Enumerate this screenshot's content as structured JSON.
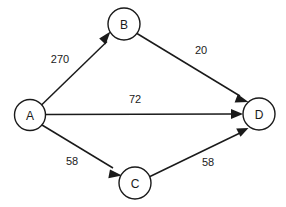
{
  "diagram": {
    "background_color": "#ffffff",
    "stroke_color": "#1a1a1a",
    "nodes": [
      {
        "id": "A",
        "label": "A",
        "cx": 30,
        "cy": 115,
        "r": 15.5
      },
      {
        "id": "B",
        "label": "B",
        "cx": 124,
        "cy": 24,
        "r": 16
      },
      {
        "id": "C",
        "label": "C",
        "cx": 135,
        "cy": 183,
        "r": 16
      },
      {
        "id": "D",
        "label": "D",
        "cx": 259,
        "cy": 114,
        "r": 16
      }
    ],
    "edges": [
      {
        "id": "A-B",
        "from": "A",
        "to": "B",
        "weight": "270",
        "label_x": 60,
        "label_y": 59
      },
      {
        "id": "B-D",
        "from": "B",
        "to": "D",
        "weight": "20",
        "label_x": 201,
        "label_y": 50
      },
      {
        "id": "A-D",
        "from": "A",
        "to": "D",
        "weight": "72",
        "label_x": 135,
        "label_y": 99
      },
      {
        "id": "A-C",
        "from": "A",
        "to": "C",
        "weight": "58",
        "label_x": 72,
        "label_y": 161
      },
      {
        "id": "C-D",
        "from": "C",
        "to": "D",
        "weight": "58",
        "label_x": 208,
        "label_y": 162
      }
    ]
  }
}
